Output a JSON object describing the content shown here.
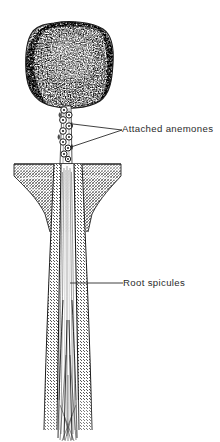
{
  "figure": {
    "kind": "scientific-line-illustration",
    "background_color": "#ffffff",
    "ink_color": "#1c1c1c",
    "label_color": "#2b2b2b",
    "width": 220,
    "height": 442
  },
  "annotations": [
    {
      "id": "attached-anemones",
      "text": "Attached  anemones",
      "x": 122,
      "y": 124,
      "leaders": 2
    },
    {
      "id": "root-spicules",
      "text": "Root  spicules",
      "x": 123,
      "y": 278,
      "leaders": 1
    }
  ],
  "parts": {
    "head": {
      "name": "sponge-body",
      "description": "stippled rounded mass",
      "top": 22,
      "bottom": 108,
      "left": 25,
      "right": 113
    },
    "stalk": {
      "name": "stalk",
      "description": "narrow column bearing ring-shaped anemones",
      "top": 104,
      "bottom": 165,
      "center_x": 66
    },
    "anemone_chain": {
      "name": "anemone-chain",
      "count": 9,
      "top": 108,
      "bottom": 162
    },
    "sediment": {
      "name": "sediment-bed",
      "description": "cross-hatched seafloor block with concave flanks",
      "top": 163,
      "bottom": 232,
      "left": 13,
      "right": 122
    },
    "root": {
      "name": "root-tuft",
      "description": "long hatched root shaft tapering into fine spicules",
      "top": 163,
      "bottom": 438,
      "center_x": 70
    }
  }
}
